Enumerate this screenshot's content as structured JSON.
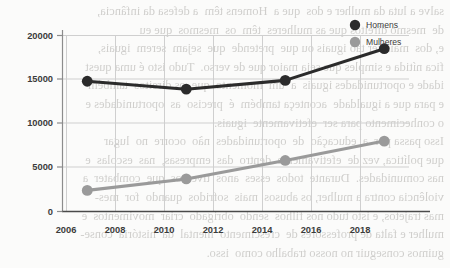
{
  "chart_data": {
    "type": "line",
    "title": "",
    "subtitle": "",
    "xlabel": "",
    "ylabel": "",
    "x": [
      2006,
      2010,
      2014,
      2018
    ],
    "categories": [
      "2006",
      "2010",
      "2014",
      "2018"
    ],
    "series": [
      {
        "name": "Homens",
        "color": "#2b2b2b",
        "values": [
          14800,
          13900,
          14900,
          18500
        ]
      },
      {
        "name": "Mulheres",
        "color": "#9a9a9a",
        "values": [
          2400,
          3700,
          5800,
          8000
        ]
      }
    ],
    "xlim": [
      2005,
      2019
    ],
    "ylim": [
      0,
      20000
    ],
    "x_ticks": [
      "2006",
      "2008",
      "2010",
      "2012",
      "2014",
      "2016",
      "2018"
    ],
    "x_tick_values": [
      2006,
      2008,
      2010,
      2012,
      2014,
      2016,
      2018
    ],
    "y_ticks": [
      "0",
      "5000",
      "10000",
      "15000",
      "20000"
    ],
    "y_tick_values": [
      0,
      5000,
      10000,
      15000,
      20000
    ],
    "grid": true,
    "grid_axis": "both",
    "legend": {
      "position": "top-right",
      "entries": [
        {
          "label": "Homens",
          "marker": "circle",
          "color": "#2b2b2b"
        },
        {
          "label": "Mulheres",
          "marker": "circle",
          "color": "#9a9a9a"
        }
      ]
    }
  },
  "axis": {
    "y_labels": [
      "20000",
      "15000",
      "10000",
      "5000",
      "0"
    ],
    "x_labels": [
      "2006",
      "2008",
      "2010",
      "2012",
      "2014",
      "2016",
      "2018"
    ]
  },
  "legend": {
    "homens": "Homens",
    "mulheres": "Mulheres"
  },
  "background_text": {
    "lines": [
      "salve a luta da mulher e dos  que a  Homens têm  a defesa da infância,",
      "de  mesmo direitos que as mulheres  têm  os  mesmos  que eu",
      "e, dos  mais ser tão iguais ou que  pretende  que  sejam  serem  iguais,",
      "fica nítida e simples que seja maior que de verso.  Tudo isto é uma quest",
      "idade e oportunidades iguais  a  um  momento  que  os direitos  também",
      "e para que a igualdade  aconteça também  é  preciso  as  oportunidades e",
      "o conhecimento para ser  efetivamente  iguais.",
      "Isso passa por  a  educação  de  oportunidades  não  ocorre  no  lugar",
      "que política, vez de  efetivamente  dentro  das  empresas,  nas  escolas  e",
      "nas comunidades.  Durante  todos  esses  anos  tivemos  que  combater  a",
      "violência contra a mulher, os abusos  mais  sofridos  quando  for  mes-",
      "mas trajetos, e isto tudo nos filhos  sendo  obrigado  criar  movimentos  e",
      "mulher e falta de professores de  crescimento  mental  da  história  conse-",
      "guimos conseguir no nosso trabalho como  isso."
    ]
  }
}
